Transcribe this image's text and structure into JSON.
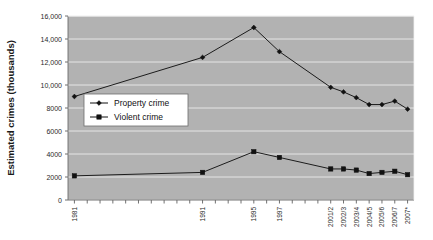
{
  "chart_data": {
    "type": "line",
    "title": "",
    "xlabel": "",
    "ylabel": "Estimated crimes (thousands)",
    "ylim": [
      0,
      16000
    ],
    "yticks": [
      0,
      2000,
      4000,
      6000,
      8000,
      10000,
      12000,
      14000,
      16000
    ],
    "ytick_labels": [
      "0",
      "2000",
      "4000",
      "6000",
      "8000",
      "10,000",
      "12,000",
      "14,000",
      "16,000"
    ],
    "grid": true,
    "legend_position": "inside-left",
    "categories": [
      "1981",
      "1982",
      "1983",
      "1984",
      "1985",
      "1986",
      "1987",
      "1988",
      "1989",
      "1990",
      "1991",
      "1992",
      "1993",
      "1994",
      "1995",
      "1996",
      "1997",
      "1998",
      "1999",
      "2000",
      "2001/2",
      "2002/3",
      "2003/4",
      "2004/5",
      "2005/6",
      "2006/7",
      "2007*"
    ],
    "labeled_categories": [
      "1981",
      "1991",
      "1995",
      "1997",
      "2001/2",
      "2002/3",
      "2003/4",
      "2004/5",
      "2005/6",
      "2006/7",
      "2007*"
    ],
    "series": [
      {
        "name": "Property crime",
        "marker": "diamond",
        "color": "#111111",
        "points": [
          {
            "x": "1981",
            "y": 9000
          },
          {
            "x": "1991",
            "y": 12400
          },
          {
            "x": "1995",
            "y": 15000
          },
          {
            "x": "1997",
            "y": 12900
          },
          {
            "x": "2001/2",
            "y": 9800
          },
          {
            "x": "2002/3",
            "y": 9400
          },
          {
            "x": "2003/4",
            "y": 8900
          },
          {
            "x": "2004/5",
            "y": 8300
          },
          {
            "x": "2005/6",
            "y": 8300
          },
          {
            "x": "2006/7",
            "y": 8600
          },
          {
            "x": "2007*",
            "y": 7900
          }
        ]
      },
      {
        "name": "Violent crime",
        "marker": "square",
        "color": "#111111",
        "points": [
          {
            "x": "1981",
            "y": 2100
          },
          {
            "x": "1991",
            "y": 2400
          },
          {
            "x": "1995",
            "y": 4200
          },
          {
            "x": "1997",
            "y": 3700
          },
          {
            "x": "2001/2",
            "y": 2700
          },
          {
            "x": "2002/3",
            "y": 2700
          },
          {
            "x": "2003/4",
            "y": 2600
          },
          {
            "x": "2004/5",
            "y": 2300
          },
          {
            "x": "2005/6",
            "y": 2400
          },
          {
            "x": "2006/7",
            "y": 2500
          },
          {
            "x": "2007*",
            "y": 2200
          }
        ]
      }
    ],
    "legend": [
      "Property crime",
      "Violent crime"
    ]
  },
  "axis": {
    "y_title": "Estimated crimes (thousands)"
  },
  "legend": {
    "entries": [
      {
        "label": "Property crime",
        "marker": "diamond"
      },
      {
        "label": "Violent crime",
        "marker": "square"
      }
    ]
  }
}
